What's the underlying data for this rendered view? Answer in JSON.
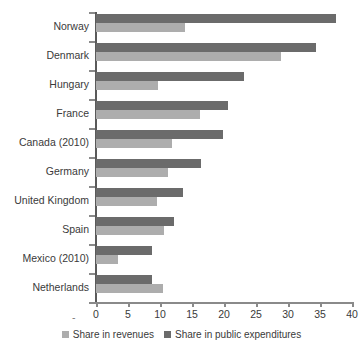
{
  "chart_data": {
    "type": "bar",
    "orientation": "horizontal",
    "title": "",
    "subtitle": "",
    "xlabel": "",
    "ylabel": "",
    "xlim": [
      0,
      40
    ],
    "xticks": [
      0,
      5,
      10,
      15,
      20,
      25,
      30,
      35,
      40
    ],
    "xtick_labels": [
      "0",
      "5",
      "10",
      "15",
      "20",
      "25",
      "30",
      "35",
      "40"
    ],
    "grid": false,
    "legend_position": "bottom",
    "axis_prefix_marker": "-",
    "categories": [
      "Norway",
      "Denmark",
      "Hungary",
      "France",
      "Canada (2010)",
      "Germany",
      "United Kingdom",
      "Spain",
      "Mexico (2010)",
      "Netherlands"
    ],
    "series": [
      {
        "name": "Share in public expenditures",
        "color": "#6b6b6b",
        "values": [
          37.5,
          34.4,
          23.1,
          20.6,
          19.9,
          16.4,
          13.6,
          12.2,
          8.8,
          8.8
        ]
      },
      {
        "name": "Share in revenues",
        "color": "#adadad",
        "values": [
          13.9,
          28.9,
          9.7,
          16.3,
          11.9,
          11.2,
          9.5,
          10.7,
          3.5,
          10.4
        ]
      }
    ],
    "legend": [
      {
        "label": "Share in revenues",
        "color": "#adadad"
      },
      {
        "label": "Share in public expenditures",
        "color": "#6b6b6b"
      }
    ]
  },
  "colors": {
    "expenditures": "#6b6b6b",
    "revenues": "#adadad",
    "axis": "#8a8a8a",
    "y_spine": "#5a5a5a",
    "text": "#3a3a3a",
    "background": "#ffffff"
  }
}
